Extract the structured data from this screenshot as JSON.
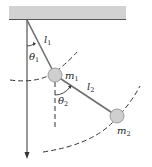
{
  "diagram": {
    "labels": {
      "l1": {
        "base": "l",
        "sub": "1"
      },
      "l2": {
        "base": "l",
        "sub": "2"
      },
      "theta1": {
        "base": "θ",
        "sub": "1"
      },
      "theta2": {
        "base": "θ",
        "sub": "2"
      },
      "m1": {
        "base": "m",
        "sub": "1"
      },
      "m2": {
        "base": "m",
        "sub": "2"
      }
    },
    "colors": {
      "ceiling": "#d2d2d2",
      "ceiling_edge": "#555555",
      "rod": "#6e6e6e",
      "mass_fill": "#cfcfcf",
      "mass_stroke": "#8a8a8a",
      "line": "#333333"
    }
  }
}
